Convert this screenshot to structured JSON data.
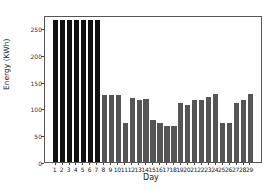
{
  "chart_data": {
    "type": "bar",
    "title": "",
    "xlabel": "Day",
    "ylabel": "Energy (KWh)",
    "ylim": [
      0,
      275
    ],
    "yticks": [
      0,
      50,
      100,
      150,
      200,
      250
    ],
    "grid": false,
    "legend": null,
    "categories": [
      "1",
      "2",
      "3",
      "4",
      "5",
      "6",
      "7",
      "8",
      "9",
      "10",
      "11",
      "12",
      "13",
      "14",
      "15",
      "16",
      "17",
      "18",
      "19",
      "20",
      "21",
      "22",
      "23",
      "24",
      "25",
      "26",
      "27",
      "28",
      "29"
    ],
    "values": [
      265,
      265,
      265,
      265,
      265,
      265,
      265,
      125,
      125,
      125,
      73,
      119,
      116,
      117,
      78,
      72,
      67,
      67,
      110,
      106,
      116,
      116,
      121,
      127,
      73,
      73,
      110,
      116,
      127
    ],
    "colors": {
      "highlight": "#111111",
      "default": "#555555",
      "highlight_days": [
        1,
        2,
        3,
        4,
        5,
        6,
        7
      ]
    }
  }
}
